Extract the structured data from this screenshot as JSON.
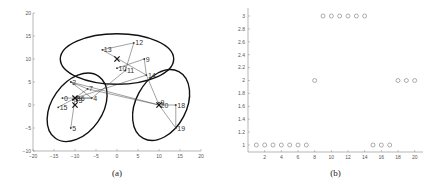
{
  "chart_data": [
    {
      "id": "a",
      "type": "scatter",
      "caption": "(a)",
      "title": "",
      "xlabel": "",
      "ylabel": "",
      "xlim": [
        -20,
        20
      ],
      "ylim": [
        -10,
        20
      ],
      "xticks": [
        -20,
        -15,
        -10,
        -5,
        0,
        5,
        10,
        15,
        20
      ],
      "yticks": [
        -10,
        -5,
        0,
        5,
        10,
        15,
        20
      ],
      "grid": false,
      "points": [
        {
          "label": "2",
          "x": -11,
          "y": 5
        },
        {
          "label": "7",
          "x": -7,
          "y": 3.5
        },
        {
          "label": "4",
          "x": -6,
          "y": 1.5
        },
        {
          "label": "8",
          "x": -10,
          "y": 1.5
        },
        {
          "label": "3",
          "x": -9.5,
          "y": 1
        },
        {
          "label": "6",
          "x": -9,
          "y": 1.5
        },
        {
          "label": "1",
          "x": -10.5,
          "y": 1.2
        },
        {
          "label": "0",
          "x": -13,
          "y": 1.5
        },
        {
          "label": "15",
          "x": -14,
          "y": -0.5
        },
        {
          "label": "5",
          "x": -11,
          "y": -5
        },
        {
          "label": "13",
          "x": -3.5,
          "y": 12
        },
        {
          "label": "12",
          "x": 4,
          "y": 13.5
        },
        {
          "label": "10",
          "x": 0,
          "y": 8
        },
        {
          "label": "11",
          "x": 2,
          "y": 7.5
        },
        {
          "label": "9",
          "x": 6.5,
          "y": 10
        },
        {
          "label": "14",
          "x": 7,
          "y": 6.5
        },
        {
          "label": "9",
          "x": 10,
          "y": 0.5
        },
        {
          "label": "20",
          "x": 10,
          "y": 0
        },
        {
          "label": "18",
          "x": 14,
          "y": 0
        },
        {
          "label": "19",
          "x": 14,
          "y": -5
        }
      ],
      "centroids": [
        {
          "x": 0,
          "y": 10
        },
        {
          "x": -10,
          "y": 1.5
        },
        {
          "x": -10,
          "y": 0
        },
        {
          "x": 10,
          "y": 0
        }
      ],
      "ellipses": [
        {
          "cx": 0,
          "cy": 10,
          "rx": 13.5,
          "ry": 5.5,
          "angle": 0
        },
        {
          "cx": -9.5,
          "cy": -0.5,
          "rx": 9,
          "ry": 5.5,
          "angle": -55
        },
        {
          "cx": 10.5,
          "cy": 0,
          "rx": 9,
          "ry": 5.5,
          "angle": -62
        }
      ],
      "edges": [
        [
          "2",
          "7"
        ],
        [
          "2",
          "4"
        ],
        [
          "7",
          "8"
        ],
        [
          "4",
          "8"
        ],
        [
          "0",
          "4"
        ],
        [
          "15",
          "8"
        ],
        [
          "5",
          "8"
        ],
        [
          "13",
          "12"
        ],
        [
          "12",
          "11"
        ],
        [
          "13",
          "14"
        ],
        [
          "10",
          "9"
        ],
        [
          "9",
          "14"
        ],
        [
          "14",
          "20"
        ],
        [
          "20",
          "18"
        ],
        [
          "18",
          "19"
        ],
        [
          "19",
          "20"
        ],
        [
          "2",
          "20"
        ],
        [
          "7",
          "20"
        ],
        [
          "8",
          "14"
        ],
        [
          "4",
          "11"
        ]
      ]
    },
    {
      "id": "b",
      "type": "scatter",
      "caption": "(b)",
      "title": "",
      "xlabel": "",
      "ylabel": "",
      "xlim": [
        0,
        21
      ],
      "ylim": [
        1,
        3
      ],
      "xticks": [
        2,
        4,
        6,
        8,
        10,
        12,
        14,
        16,
        18,
        20
      ],
      "yticks": [
        1,
        1.2,
        1.4,
        1.6,
        1.8,
        2,
        2.2,
        2.4,
        2.6,
        2.8,
        3
      ],
      "ytick_labels": [
        "1",
        "1.2",
        "1.4",
        "1.6",
        "1.8",
        "2",
        "2.2",
        "2.4",
        "2.6",
        "2.8",
        "3"
      ],
      "grid": false,
      "marker": "circle-open",
      "x": [
        1,
        2,
        3,
        4,
        5,
        6,
        7,
        8,
        9,
        10,
        11,
        12,
        13,
        14,
        15,
        16,
        17,
        18,
        19,
        20
      ],
      "y": [
        1,
        1,
        1,
        1,
        1,
        1,
        1,
        2,
        3,
        3,
        3,
        3,
        3,
        3,
        1,
        1,
        1,
        2,
        2,
        2
      ]
    }
  ]
}
